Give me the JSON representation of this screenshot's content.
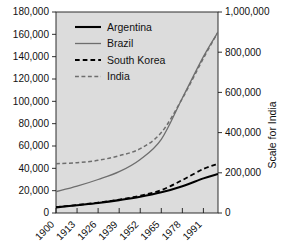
{
  "chart_data": {
    "type": "line",
    "title": "",
    "subtitle": "",
    "xlabel": "",
    "ylabel": "",
    "y2label": "Scale for India",
    "grid": false,
    "legend_position": "top-left-inside",
    "background_color": "#dcdcdc",
    "x": [
      1900,
      1913,
      1926,
      1939,
      1952,
      1965,
      1978,
      1991
    ],
    "xtick_labels": [
      "1900",
      "1913",
      "1926",
      "1939",
      "1952",
      "1965",
      "1978",
      "1991"
    ],
    "xlim": [
      1900,
      2000
    ],
    "ylim": [
      0,
      180000
    ],
    "ytick_labels": [
      "0",
      "20,000",
      "40,000",
      "60,000",
      "80,000",
      "100,000",
      "120,000",
      "140,000",
      "160,000",
      "180,000"
    ],
    "ytick_values": [
      0,
      20000,
      40000,
      60000,
      80000,
      100000,
      120000,
      140000,
      160000,
      180000
    ],
    "y2lim": [
      0,
      1000000
    ],
    "y2tick_labels": [
      "0",
      "200,000",
      "400,000",
      "600,000",
      "800,000",
      "1,000,000"
    ],
    "y2tick_values": [
      0,
      200000,
      400000,
      600000,
      800000,
      1000000
    ],
    "series": [
      {
        "name": "Argentina",
        "axis": "left",
        "color": "#000000",
        "style": "solid",
        "width": 2.1,
        "x": [
          1900,
          1913,
          1926,
          1939,
          1952,
          1965,
          1978,
          1991,
          2000
        ],
        "values": [
          5000,
          7000,
          9000,
          11500,
          14500,
          18500,
          24000,
          31000,
          35000
        ]
      },
      {
        "name": "Brazil",
        "axis": "left",
        "color": "#6e6e6e",
        "style": "solid",
        "width": 1.3,
        "x": [
          1900,
          1913,
          1926,
          1939,
          1952,
          1965,
          1978,
          1991,
          2000
        ],
        "values": [
          19000,
          24000,
          30000,
          37000,
          48000,
          66000,
          103000,
          140000,
          162000
        ]
      },
      {
        "name": "South Korea",
        "axis": "left",
        "color": "#000000",
        "style": "dashed",
        "width": 1.8,
        "x": [
          1900,
          1913,
          1926,
          1939,
          1952,
          1965,
          1978,
          1991,
          2000
        ],
        "values": [
          5200,
          7200,
          9300,
          12000,
          15500,
          20500,
          29500,
          39500,
          44000
        ]
      },
      {
        "name": "India",
        "axis": "right",
        "color": "#6e6e6e",
        "style": "dashed",
        "width": 1.5,
        "x": [
          1900,
          1913,
          1926,
          1939,
          1952,
          1965,
          1978,
          1991,
          2000
        ],
        "values": [
          245000,
          250000,
          262000,
          285000,
          320000,
          400000,
          570000,
          770000,
          900000
        ]
      }
    ]
  },
  "legend": {
    "items": [
      {
        "label": "Argentina"
      },
      {
        "label": "Brazil"
      },
      {
        "label": "South Korea"
      },
      {
        "label": "India"
      }
    ]
  },
  "axes": {
    "right_title": "Scale for India"
  }
}
